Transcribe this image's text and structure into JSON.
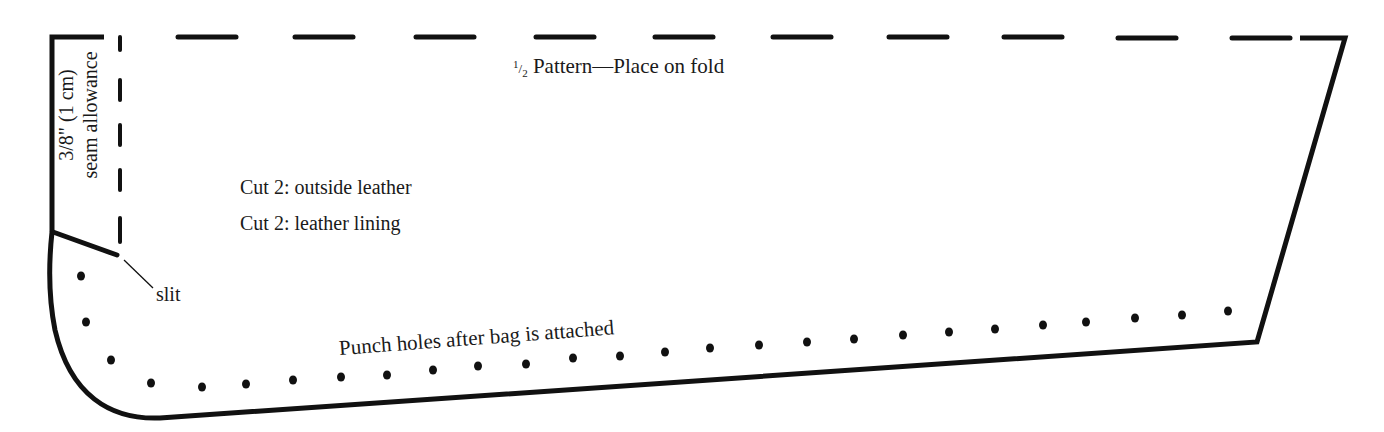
{
  "pattern": {
    "title": "½ Pattern—Place on fold",
    "title_fraction": "1/2",
    "title_text": "Pattern—Place on fold",
    "instructions": [
      "Cut 2: outside leather",
      "Cut 2: leather lining"
    ],
    "seam_allowance": {
      "line1": "3/8\" (1 cm)",
      "line2": "seam allowance"
    },
    "slit_label": "slit",
    "punch_label": "Punch holes after bag is attached",
    "colors": {
      "line": "#111111",
      "background": "#ffffff",
      "text": "#1a1a1a"
    },
    "outline": {
      "top_fold_edge": "dashed",
      "right_edge": "solid",
      "bottom_edge": "solid",
      "left_curve": "solid"
    },
    "punch_hole_count": 27
  }
}
